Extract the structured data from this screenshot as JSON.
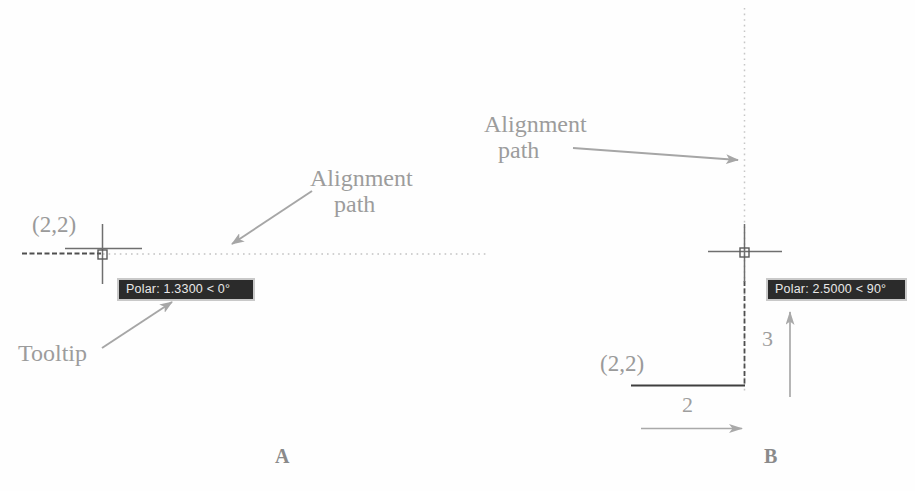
{
  "figure": {
    "background_color": "#fefefe",
    "line_color_dark": "#4a4a4a",
    "line_color_light": "#b0b0b0",
    "label_color": "#9a9a9a",
    "tooltip_bg": "#2b2b2b",
    "tooltip_text_color": "#e8e8e8",
    "tooltip_border": "#c9c9c9"
  },
  "panels": [
    {
      "id": "A",
      "label": "A",
      "coordinate_label": "(2,2)",
      "tooltip": "Polar: 1.3300 < 0°",
      "callouts": [
        {
          "name": "alignment-path",
          "line1": "Alignment",
          "line2": "path"
        },
        {
          "name": "tooltip",
          "line1": "Tooltip",
          "line2": ""
        }
      ]
    },
    {
      "id": "B",
      "label": "B",
      "coordinate_label": "(2,2)",
      "tooltip": "Polar: 2.5000 < 90°",
      "callouts": [
        {
          "name": "alignment-path",
          "line1": "Alignment",
          "line2": "path"
        }
      ],
      "dimensions": [
        {
          "name": "horizontal-dimension",
          "value": "2"
        },
        {
          "name": "vertical-dimension",
          "value": "3"
        }
      ]
    }
  ]
}
